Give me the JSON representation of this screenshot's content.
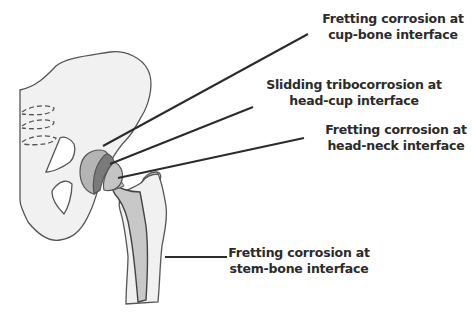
{
  "diagram": {
    "type": "annotated-anatomical-illustration",
    "colors": {
      "bone_fill": "#f1f1f1",
      "bone_outline": "#555555",
      "cup_fill": "#b4b4b4",
      "liner_fill": "#7a7a7a",
      "head_fill": "#c4c4c4",
      "stem_fill": "#c8c8c8",
      "leader_line": "#2b2b2b",
      "text": "#2b2b2b"
    },
    "labels": [
      {
        "id": "cup-bone",
        "line1": "Fretting corrosion at",
        "line2": "cup-bone interface"
      },
      {
        "id": "head-cup",
        "line1": "Slidding tribocorrosion at",
        "line2": "head-cup interface"
      },
      {
        "id": "head-neck",
        "line1": "Fretting corrosion at",
        "line2": "head-neck interface"
      },
      {
        "id": "stem-bone",
        "line1": "Fretting corrosion at",
        "line2": "stem-bone interface"
      }
    ]
  }
}
